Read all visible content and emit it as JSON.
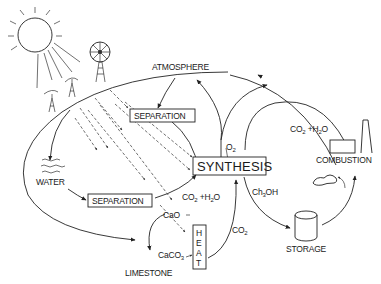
{
  "diagram": {
    "nodes": {
      "atmosphere": "ATMOSPHERE",
      "separation_top": "SEPARATION",
      "separation_bottom": "SEPARATION",
      "synthesis": "SYNTHESIS",
      "water": "WATER",
      "combustion": "COMBUSTION",
      "storage": "STORAGE",
      "limestone": "LIMESTONE",
      "heat": [
        "H",
        "E",
        "A",
        "T"
      ]
    },
    "labels": {
      "o2": {
        "main": "O",
        "sub": "2"
      },
      "co2_h2o_top": {
        "a": "CO",
        "a_sub": "2",
        "plus": " +H",
        "b_sub": "2",
        "c": "O"
      },
      "co2_h2o_mid": {
        "a": "CO",
        "a_sub": "2",
        "plus": " +H",
        "b_sub": "2",
        "c": "O"
      },
      "ch3oh": {
        "a": "Ch",
        "sub": "3",
        "b": "OH"
      },
      "co2_right": {
        "a": "CO",
        "sub": "2"
      },
      "cao": "CaO",
      "caco3": {
        "a": "CaCO",
        "sub": "3"
      }
    },
    "icons": [
      "sun-icon",
      "windmill-icon",
      "power-pylon-icon",
      "car-icon",
      "smokestack-icon",
      "storage-tank-icon",
      "water-waves-icon"
    ],
    "colors": {
      "ink": "#222222",
      "background": "#ffffff"
    }
  }
}
